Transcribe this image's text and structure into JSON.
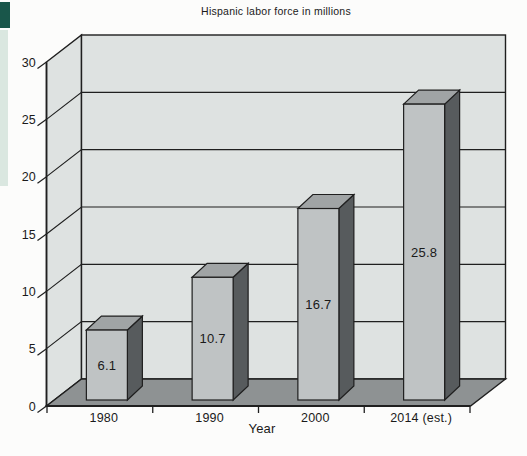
{
  "page": {
    "background": "#fcfcfb",
    "edge_strips": {
      "dark_color": "#19564a",
      "pale_color": "#dae7e0"
    }
  },
  "chart_data": {
    "type": "bar",
    "projection": "3d",
    "title": "Hispanic labor force in millions",
    "xlabel": "Year",
    "ylabel": "",
    "categories": [
      "1980",
      "1990",
      "2000",
      "2014 (est.)"
    ],
    "values": [
      6.1,
      10.7,
      16.7,
      25.8
    ],
    "value_labels": [
      "6.1",
      "10.7",
      "16.7",
      "25.8"
    ],
    "ylim": [
      0,
      30
    ],
    "ytick_step": 5,
    "yticks": [
      0,
      5,
      10,
      15,
      20,
      25,
      30
    ],
    "ytick_labels": [
      "0",
      "5",
      "10",
      "15",
      "20",
      "25",
      "30"
    ],
    "grid": true,
    "legend": null,
    "colors": {
      "wall": "#dee2e1",
      "floor": "#8e9293",
      "bar_front": "#bfc3c4",
      "bar_top": "#a0a4a5",
      "bar_side": "#575b5d",
      "line": "#1f1f1f",
      "text": "#1a1a1a"
    }
  }
}
